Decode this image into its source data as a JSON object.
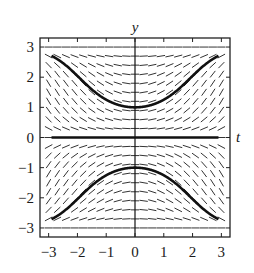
{
  "chart_data": {
    "type": "line",
    "subtype": "slope-field",
    "title": "",
    "xlabel": "t",
    "ylabel": "y",
    "xlim": [
      -3.3,
      3.3
    ],
    "ylim": [
      -3.3,
      3.3
    ],
    "xticks": [
      -3,
      -2,
      -1,
      0,
      1,
      2,
      3
    ],
    "yticks": [
      -3,
      -2,
      -1,
      0,
      1,
      2,
      3
    ],
    "xtick_labels": [
      "−3",
      "−2",
      "−1",
      "0",
      "1",
      "2",
      "3"
    ],
    "ytick_labels": [
      "−3",
      "−2",
      "−1",
      "0",
      "1",
      "2",
      "3"
    ],
    "grid": false,
    "legend": null,
    "slope_field": {
      "description": "direction field for dy/dt proportional to t*sin(pi*y/3)",
      "t_range": [
        -3,
        3
      ],
      "y_range": [
        -3,
        3
      ],
      "t_step": 0.3,
      "y_step": 0.3,
      "gain": 0.55,
      "color": "#333333"
    },
    "series": [
      {
        "name": "solution y(0)=1",
        "initial_condition": {
          "t": 0,
          "y": 1
        },
        "t_range": [
          -2.9,
          2.9
        ],
        "approx_points": [
          [
            -2.9,
            2.72
          ],
          [
            -2,
            2.35
          ],
          [
            -1,
            1.45
          ],
          [
            0,
            1.0
          ],
          [
            1,
            1.45
          ],
          [
            2,
            2.35
          ],
          [
            2.9,
            2.72
          ]
        ],
        "color": "#111111"
      },
      {
        "name": "solution y(0)=-1",
        "initial_condition": {
          "t": 0,
          "y": -1
        },
        "t_range": [
          -2.9,
          2.9
        ],
        "approx_points": [
          [
            -2.9,
            -2.72
          ],
          [
            -2,
            -2.35
          ],
          [
            -1,
            -1.45
          ],
          [
            0,
            -1.0
          ],
          [
            1,
            -1.45
          ],
          [
            2,
            -2.35
          ],
          [
            2.9,
            -2.72
          ]
        ],
        "color": "#111111"
      },
      {
        "name": "equilibrium y=0",
        "initial_condition": {
          "t": 0,
          "y": 0
        },
        "t_range": [
          -2.9,
          2.9
        ],
        "approx_points": [
          [
            -2.9,
            0
          ],
          [
            2.9,
            0
          ]
        ],
        "color": "#111111"
      }
    ]
  }
}
